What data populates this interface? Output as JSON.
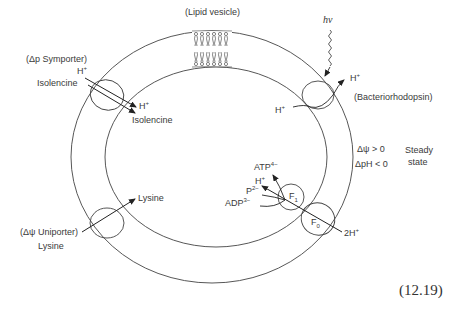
{
  "diagram": {
    "title": "(Lipid vesicle)",
    "equation_number": "(12.19)",
    "photon_label": "hν",
    "symporter": {
      "name": "(Δp Symporter)",
      "in_h": "H",
      "in_h_sup": "+",
      "in_substrate": "Isolencine",
      "out_h": "H",
      "out_h_sup": "+",
      "out_substrate": "Isolencine"
    },
    "bacteriorhodopsin": {
      "name": "(Bacteriorhodopsin)",
      "h_in": "H",
      "h_in_sup": "+",
      "h_out": "H",
      "h_out_sup": "+"
    },
    "uniporter": {
      "name": "(Δψ Uniporter)",
      "substrate_out": "Lysine",
      "substrate_in": "Lysine"
    },
    "atp_synthase": {
      "f1": "F",
      "f1_sub": "1",
      "f0": "F",
      "f0_sub": "0",
      "atp": "ATP",
      "atp_sup": "4−",
      "h": "H",
      "h_sup": "+",
      "p": "P",
      "p_sup": "2−",
      "adp": "ADP",
      "adp_sup": "3−",
      "two_h": "2H",
      "two_h_sup": "+"
    },
    "conditions": {
      "psi": "Δψ  > 0",
      "ph": "ΔpH < 0",
      "state_line1": "Steady",
      "state_line2": "state"
    }
  }
}
